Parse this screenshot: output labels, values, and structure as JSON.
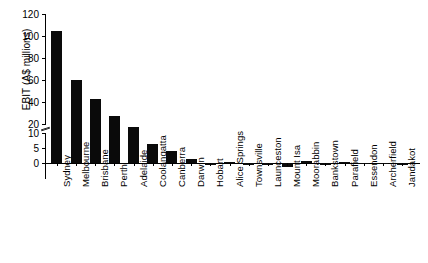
{
  "chart_data": {
    "type": "bar",
    "title": "",
    "xlabel": "",
    "ylabel": "EBIT (A$ millions)",
    "orientation": "vertical",
    "grid": false,
    "legend": null,
    "axis_break": true,
    "axis_break_between": [
      10,
      20
    ],
    "ylim": [
      -5,
      120
    ],
    "ytick_labels": [
      "120",
      "100",
      "80",
      "60",
      "40",
      "20",
      "10",
      "5",
      "0",
      "-5"
    ],
    "ytick_values": [
      120,
      100,
      80,
      60,
      40,
      20,
      10,
      5,
      0,
      -5
    ],
    "categories": [
      "Sydney",
      "Melbourne",
      "Brisbane",
      "Perth",
      "Adelaide",
      "Coolangatta",
      "Canberra",
      "Darwin",
      "Hobart",
      "Alice Springs",
      "Townsville",
      "Launceston",
      "Mount Isa",
      "Moorabbin",
      "Bankstown",
      "Parafield",
      "Essendon",
      "Archerfield",
      "Jandakot"
    ],
    "values": [
      105,
      60,
      43,
      27,
      12,
      6.5,
      4,
      1.3,
      -0.8,
      0.5,
      -0.5,
      -0.6,
      -1.2,
      0.6,
      -0.8,
      0.2,
      -0.3,
      -0.3,
      -0.5
    ],
    "bar_color": "#0a0a0a",
    "background_color": "#ffffff"
  }
}
